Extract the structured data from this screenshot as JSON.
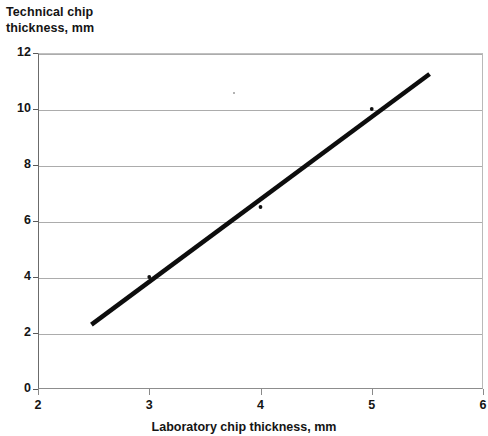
{
  "chart_data": {
    "type": "scatter",
    "title": "",
    "xlabel": "Laboratory chip thickness, mm",
    "ylabel": "Technical chip thickness, mm",
    "ylabel_line1": "Technical chip",
    "ylabel_line2": "thickness, mm",
    "xlim": [
      2,
      6
    ],
    "ylim": [
      0,
      12
    ],
    "xticks": [
      2,
      3,
      4,
      5,
      6
    ],
    "yticks": [
      0,
      2,
      4,
      6,
      8,
      10,
      12
    ],
    "xtick_labels": [
      "2",
      "3",
      "4",
      "5",
      "6"
    ],
    "ytick_labels": [
      "0",
      "2",
      "4",
      "6",
      "8",
      "10",
      "12"
    ],
    "grid": "horizontal",
    "legend": "none",
    "series": [
      {
        "name": "Measured chips",
        "type": "scatter",
        "marker": "dot",
        "color": "#111111",
        "points": [
          {
            "x": 3.0,
            "y": 4.0
          },
          {
            "x": 4.0,
            "y": 6.5
          },
          {
            "x": 5.0,
            "y": 10.0
          }
        ]
      },
      {
        "name": "Trend line",
        "type": "line",
        "color": "#0d0d0d",
        "linewidth": 4.5,
        "points": [
          {
            "x": 2.48,
            "y": 2.3
          },
          {
            "x": 5.52,
            "y": 11.25
          }
        ]
      }
    ],
    "annotations": [
      {
        "kind": "scan-artifact",
        "x": 3.75,
        "y": 10.6
      }
    ]
  },
  "axes": {
    "y_title_line1": "Technical chip",
    "y_title_line2": "thickness, mm",
    "x_title": "Laboratory chip thickness, mm"
  }
}
